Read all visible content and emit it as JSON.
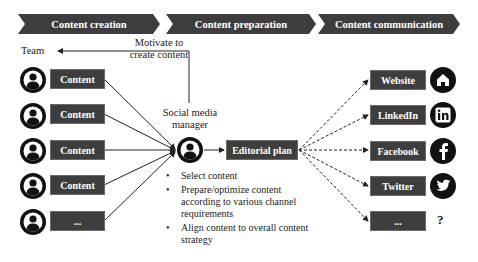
{
  "phases": [
    {
      "label": "Content creation"
    },
    {
      "label": "Content preparation"
    },
    {
      "label": "Content communication"
    }
  ],
  "team": {
    "label": "Team"
  },
  "motivate": {
    "line1": "Motivate to",
    "line2": "create content"
  },
  "contents": [
    {
      "label": "Content"
    },
    {
      "label": "Content"
    },
    {
      "label": "Content"
    },
    {
      "label": "Content"
    },
    {
      "label": "..."
    }
  ],
  "manager": {
    "line1": "Social media",
    "line2": "manager"
  },
  "editorial": {
    "label": "Editorial plan"
  },
  "tasks": [
    "Select content",
    "Prepare/optimize content according to various channel requirements",
    "Align content to overall content strategy"
  ],
  "channels": [
    {
      "label": "Website",
      "icon": "home-icon"
    },
    {
      "label": "LinkedIn",
      "icon": "linkedin-icon"
    },
    {
      "label": "Facebook",
      "icon": "facebook-icon"
    },
    {
      "label": "Twitter",
      "icon": "twitter-icon"
    },
    {
      "label": "...",
      "icon": "question-mark"
    }
  ],
  "unknown_symbol": "?",
  "colors": {
    "box": "#3e3e3e",
    "icon": "#111111",
    "line": "#222222"
  }
}
